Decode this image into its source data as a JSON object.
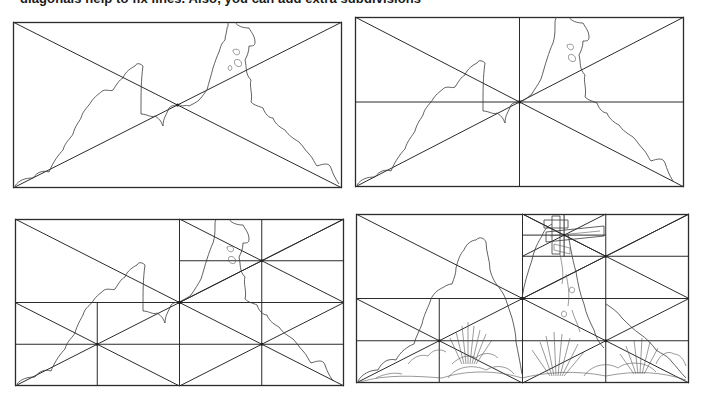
{
  "caption": {
    "text": "diagonals help to fix lines. Also, you can add extra subdivisions"
  },
  "colors": {
    "background": "#ffffff",
    "line": "#2b2b2b",
    "caption": "#1a1a1a"
  },
  "panels": [
    {
      "id": "panel-1",
      "label": "Rectangle with two diagonals",
      "x": 13,
      "y": 22,
      "width": 329,
      "height": 166,
      "subdivision_level": 0
    },
    {
      "id": "panel-2",
      "label": "Diagonals plus vertical and horizontal centre lines",
      "x": 355,
      "y": 17,
      "width": 329,
      "height": 170,
      "subdivision_level": 1
    },
    {
      "id": "panel-3",
      "label": "Quadrants subdivided with their own diagonals",
      "x": 15,
      "y": 219,
      "width": 329,
      "height": 167,
      "subdivision_level": 2
    },
    {
      "id": "panel-4",
      "label": "Further subdivision with finished landscape drawing",
      "x": 356,
      "y": 214,
      "width": 333,
      "height": 169,
      "subdivision_level": 3
    }
  ],
  "scene": {
    "elements": [
      "bushes-left",
      "rock-tower-right",
      "grass-tufts",
      "street-sign",
      "foreground-shrubs"
    ]
  }
}
